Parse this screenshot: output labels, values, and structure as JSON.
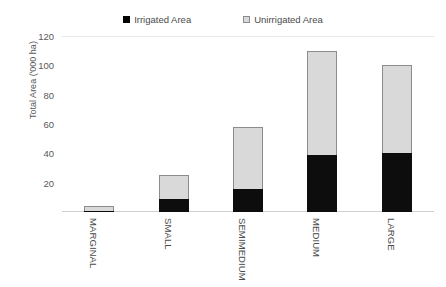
{
  "chart_data": {
    "type": "bar",
    "subtype": "stacked-vertical",
    "title": "",
    "xlabel": "",
    "ylabel": "Total Area ('000 ha)",
    "categories": [
      "MARGINAL",
      "SMALL",
      "SEMIMEDIUM",
      "MEDIUM",
      "LARGE"
    ],
    "series": [
      {
        "name": "Irrigated Area",
        "color": "#000000",
        "values": [
          0.5,
          9,
          16,
          39,
          40
        ]
      },
      {
        "name": "Unirrigated Area",
        "color": "#D9D9D9",
        "values": [
          3.5,
          16,
          42,
          71,
          60
        ]
      }
    ],
    "totals": [
      4,
      25,
      58,
      110,
      100
    ],
    "ylim": [
      0,
      120
    ],
    "yticks": [
      20,
      40,
      60,
      80,
      100,
      120
    ],
    "ytick_labels": [
      "20",
      "40",
      "60",
      "80",
      "100",
      "120"
    ],
    "grid": "horizontal-top-only",
    "legend_position": "top-center",
    "legend_entries": [
      "Irrigated Area",
      "Unirrigated Area"
    ]
  },
  "axis": {
    "y_title": "Total Area ('000 ha)"
  },
  "colors": {
    "irrigated": "#000000",
    "unirrigated": "#D9D9D9",
    "bar_border": "#8C8C8C",
    "gridline": "#E8E8E8",
    "text": "#595959",
    "background": "#FFFFFF"
  }
}
